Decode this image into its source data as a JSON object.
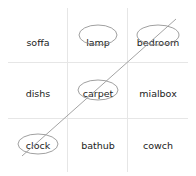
{
  "grid": {
    "rows": [
      [
        {
          "label": "soffa",
          "circled": false
        },
        {
          "label": "lamp",
          "circled": true
        },
        {
          "label": "bedroom",
          "circled": true
        }
      ],
      [
        {
          "label": "dishs",
          "circled": false
        },
        {
          "label": "carpet",
          "circled": true
        },
        {
          "label": "mialbox",
          "circled": false
        }
      ],
      [
        {
          "label": "clock",
          "circled": true
        },
        {
          "label": "bathub",
          "circled": false
        },
        {
          "label": "cowch",
          "circled": false
        }
      ]
    ]
  },
  "strike_line": {
    "from": "clock",
    "to": "bedroom",
    "color": "#999999"
  },
  "colors": {
    "ellipse": "#888888",
    "divider": "#e6e6e6"
  }
}
